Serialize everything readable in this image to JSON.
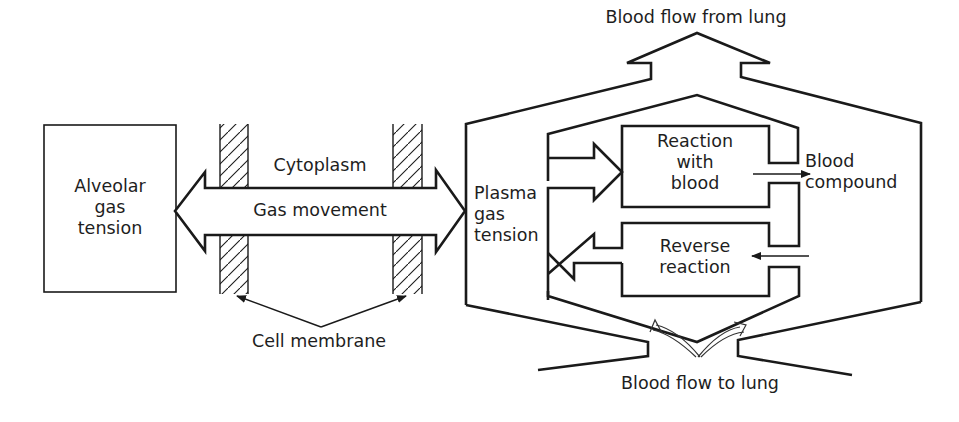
{
  "diagram": {
    "type": "schematic",
    "colors": {
      "line": "#1a1a1a",
      "text": "#1e1e1e",
      "background": "#ffffff"
    },
    "labels": {
      "alveolar": [
        "Alveolar",
        "gas",
        "tension"
      ],
      "cytoplasm": "Cytoplasm",
      "gas_movement": "Gas movement",
      "cell_membrane": "Cell membrane",
      "plasma": [
        "Plasma",
        "gas",
        "tension"
      ],
      "reaction": [
        "Reaction",
        "with",
        "blood"
      ],
      "reverse": [
        "Reverse",
        "reaction"
      ],
      "blood_compound": [
        "Blood",
        "compound"
      ],
      "flow_from_lung": "Blood flow from lung",
      "flow_to_lung": "Blood flow to lung"
    },
    "nodes": [
      {
        "id": "alveolar-gas-tension",
        "label": "Alveolar gas tension"
      },
      {
        "id": "cell-membrane-left",
        "label": "Cell membrane"
      },
      {
        "id": "cytoplasm",
        "label": "Cytoplasm"
      },
      {
        "id": "cell-membrane-right",
        "label": "Cell membrane"
      },
      {
        "id": "plasma-gas-tension",
        "label": "Plasma gas tension"
      },
      {
        "id": "reaction-with-blood",
        "label": "Reaction with blood"
      },
      {
        "id": "reverse-reaction",
        "label": "Reverse reaction"
      },
      {
        "id": "blood-compound",
        "label": "Blood compound"
      }
    ],
    "edges": [
      {
        "from": "alveolar-gas-tension",
        "to": "plasma-gas-tension",
        "label": "Gas movement",
        "bidirectional": true
      },
      {
        "from": "plasma-gas-tension",
        "to": "reaction-with-blood"
      },
      {
        "from": "reaction-with-blood",
        "to": "blood-compound"
      },
      {
        "from": "blood-compound",
        "to": "reverse-reaction"
      },
      {
        "from": "reverse-reaction",
        "to": "plasma-gas-tension"
      }
    ]
  }
}
